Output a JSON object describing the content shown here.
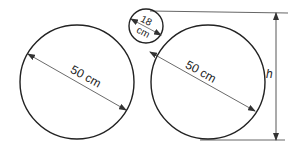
{
  "diagram": {
    "large_left": {
      "label": "50 cm",
      "cx": 77,
      "cy": 82,
      "r": 57
    },
    "large_right": {
      "label": "50 cm",
      "cx": 208,
      "cy": 82,
      "r": 57
    },
    "small_top": {
      "label_line1": "18",
      "label_line2": "cm",
      "cx": 146,
      "cy": 26,
      "r": 17
    },
    "height_label": "h",
    "line_color": "#222222",
    "arrow_color": "#444444"
  }
}
